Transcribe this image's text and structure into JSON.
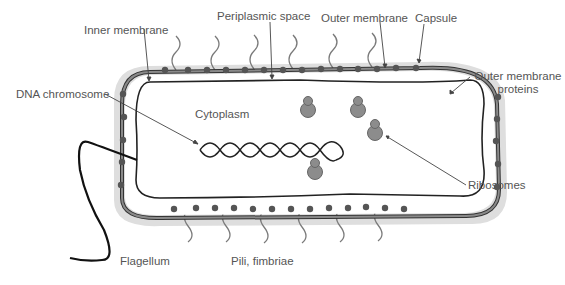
{
  "diagram": {
    "colors": {
      "capsule": "#dcdcdc",
      "outer_membrane": "#7a7a7a",
      "membrane_line": "#333333",
      "protein": "#555555",
      "ribosome": "#8c8c8c",
      "leader": "#444444",
      "text": "#555555"
    },
    "labels": {
      "inner_membrane": "Inner membrane",
      "periplasmic_space": "Periplasmic space",
      "outer_membrane": "Outer membrane",
      "capsule": "Capsule",
      "outer_membrane_proteins_line1": "Outer membrane",
      "outer_membrane_proteins_line2": "proteins",
      "dna_chromosome": "DNA chromosome",
      "cytoplasm": "Cytoplasm",
      "ribosomes": "Ribosomes",
      "flagellum": "Flagellum",
      "pili_fimbriae": "Pili, fimbriae"
    },
    "components": [
      "capsule",
      "outer-membrane",
      "periplasmic-space",
      "inner-membrane",
      "cytoplasm",
      "dna-chromosome",
      "ribosomes",
      "outer-membrane-proteins",
      "flagellum",
      "pili"
    ]
  }
}
